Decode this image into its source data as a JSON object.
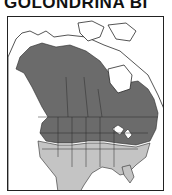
{
  "title": "GOLONDRINA BI",
  "map": {
    "region": "North America",
    "colors": {
      "breeding": "#6b6b6b",
      "winter": "#c4c4c4",
      "land": "#ffffff",
      "borders": "#2a2a2a",
      "frame": "#222222"
    }
  }
}
